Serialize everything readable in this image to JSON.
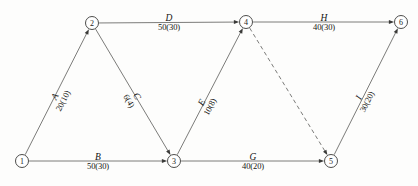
{
  "diagram": {
    "type": "aoa-network",
    "line_color": "#5a5a58",
    "node_stroke_color": "#3a3a38",
    "text_color": "#141412",
    "background_color": "#fdfdfc"
  },
  "nodes": [
    {
      "id": "1",
      "label": "1",
      "x": 22,
      "y": 161,
      "r": 6.5
    },
    {
      "id": "2",
      "label": "2",
      "x": 92,
      "y": 23,
      "r": 6.5
    },
    {
      "id": "3",
      "label": "3",
      "x": 174,
      "y": 161,
      "r": 6.5
    },
    {
      "id": "4",
      "label": "4",
      "x": 246,
      "y": 22,
      "r": 6.5
    },
    {
      "id": "5",
      "label": "5",
      "x": 331,
      "y": 161,
      "r": 6.5
    },
    {
      "id": "6",
      "label": "6",
      "x": 401,
      "y": 22,
      "r": 6.5
    }
  ],
  "edges": [
    {
      "id": "A",
      "name": "A",
      "duration": "20(10)",
      "from": "1",
      "to": "2",
      "style": "solid",
      "orientation": "slanted",
      "label_x": 59,
      "label_y": 98,
      "rotate": -63
    },
    {
      "id": "B",
      "name": "B",
      "duration": "50(30)",
      "from": "1",
      "to": "3",
      "style": "solid",
      "orientation": "horizontal",
      "label_x": 98,
      "label_y": 161,
      "rotate": 0
    },
    {
      "id": "C",
      "name": "C",
      "duration": "6(4)",
      "from": "2",
      "to": "3",
      "style": "solid",
      "orientation": "slanted",
      "label_x": 133,
      "label_y": 98,
      "rotate": 59
    },
    {
      "id": "D",
      "name": "D",
      "duration": "50(30)",
      "from": "2",
      "to": "4",
      "style": "solid",
      "orientation": "horizontal",
      "label_x": 169,
      "label_y": 22,
      "rotate": 0
    },
    {
      "id": "E",
      "name": "E",
      "duration": "10(8)",
      "from": "3",
      "to": "4",
      "style": "solid",
      "orientation": "slanted",
      "label_x": 206,
      "label_y": 104,
      "rotate": -62
    },
    {
      "id": "G",
      "name": "G",
      "duration": "40(20)",
      "from": "3",
      "to": "5",
      "style": "solid",
      "orientation": "horizontal",
      "label_x": 253,
      "label_y": 161,
      "rotate": 0
    },
    {
      "id": "H",
      "name": "H",
      "duration": "40(30)",
      "from": "4",
      "to": "6",
      "style": "solid",
      "orientation": "horizontal",
      "label_x": 324,
      "label_y": 22,
      "rotate": 0
    },
    {
      "id": "I",
      "name": "I",
      "duration": "30(20)",
      "from": "5",
      "to": "6",
      "style": "solid",
      "orientation": "slanted",
      "label_x": 363,
      "label_y": 99,
      "rotate": -63
    },
    {
      "id": "F",
      "name": "",
      "duration": "",
      "from": "4",
      "to": "5",
      "style": "dashed",
      "orientation": "slanted",
      "label_x": 0,
      "label_y": 0,
      "rotate": 0
    }
  ]
}
